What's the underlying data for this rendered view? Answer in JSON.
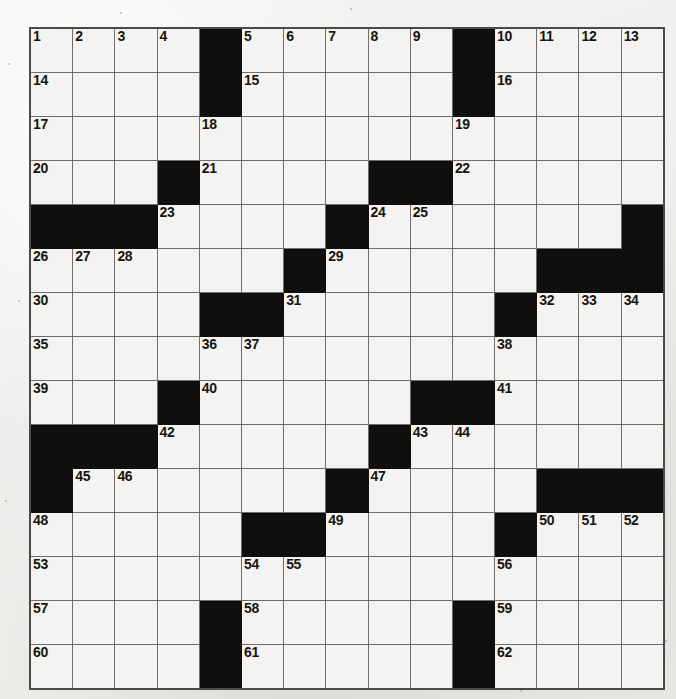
{
  "puzzle": {
    "title": "Crossword Puzzle Grid",
    "rows": 15,
    "cols": 15,
    "colors": {
      "paper": "#f2f1ef",
      "cell": "#f4f3f1",
      "block": "#100f0d",
      "gridline": "#6e6e6e",
      "border": "#4a4a4a",
      "number": "#16160f"
    },
    "grid": [
      [
        "1",
        "2",
        "3",
        "4",
        "#",
        "5",
        "6",
        "7",
        "8",
        "9",
        "#",
        "10",
        "11",
        "12",
        "13"
      ],
      [
        "14",
        "",
        "",
        "",
        "#",
        "15",
        "",
        "",
        "",
        "",
        "#",
        "16",
        "",
        "",
        ""
      ],
      [
        "17",
        "",
        "",
        "",
        "18",
        "",
        "",
        "",
        "",
        "",
        "19",
        "",
        "",
        "",
        ""
      ],
      [
        "20",
        "",
        "",
        "#",
        "21",
        "",
        "",
        "",
        "#",
        "#",
        "22",
        "",
        "",
        "",
        ""
      ],
      [
        "#",
        "#",
        "#",
        "23",
        "",
        "",
        "",
        "#",
        "24",
        "25",
        "",
        "",
        "",
        "",
        "#"
      ],
      [
        "26",
        "27",
        "28",
        "",
        "",
        "",
        "#",
        "29",
        "",
        "",
        "",
        "",
        "#",
        "#",
        "#"
      ],
      [
        "30",
        "",
        "",
        "",
        "#",
        "#",
        "31",
        "",
        "",
        "",
        "",
        "#",
        "32",
        "33",
        "34"
      ],
      [
        "35",
        "",
        "",
        "",
        "36",
        "37",
        "",
        "",
        "",
        "",
        "",
        "38",
        "",
        "",
        ""
      ],
      [
        "39",
        "",
        "",
        "#",
        "40",
        "",
        "",
        "",
        "",
        "#",
        "#",
        "41",
        "",
        "",
        ""
      ],
      [
        "#",
        "#",
        "#",
        "42",
        "",
        "",
        "",
        "",
        "#",
        "43",
        "44",
        "",
        "",
        "",
        ""
      ],
      [
        "#",
        "45",
        "46",
        "",
        "",
        "",
        "",
        "#",
        "47",
        "",
        "",
        "",
        "#",
        "#",
        "#"
      ],
      [
        "48",
        "",
        "",
        "",
        "",
        "#",
        "#",
        "49",
        "",
        "",
        "",
        "#",
        "50",
        "51",
        "52"
      ],
      [
        "53",
        "",
        "",
        "",
        "",
        "54",
        "55",
        "",
        "",
        "",
        "",
        "56",
        "",
        "",
        ""
      ],
      [
        "57",
        "",
        "",
        "",
        "#",
        "58",
        "",
        "",
        "",
        "",
        "#",
        "59",
        "",
        "",
        ""
      ],
      [
        "60",
        "",
        "",
        "",
        "#",
        "61",
        "",
        "",
        "",
        "",
        "#",
        "62",
        "",
        "",
        ""
      ]
    ]
  }
}
